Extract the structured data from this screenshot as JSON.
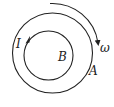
{
  "diagram": {
    "labels": {
      "current": "I",
      "field": "B",
      "ring": "A",
      "angular_velocity": "ω"
    },
    "colors": {
      "stroke": "#222222",
      "background": "#ffffff"
    }
  }
}
